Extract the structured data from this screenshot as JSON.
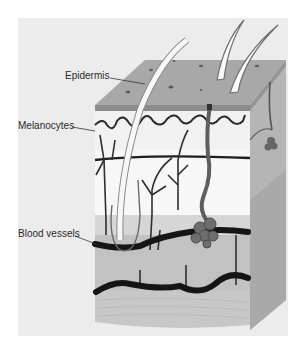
{
  "figure": {
    "labels": [
      {
        "id": "epidermis",
        "text": "Epidermis"
      },
      {
        "id": "melanocytes",
        "text": "Melanocytes"
      },
      {
        "id": "blood_vessels",
        "text": "Blood vessels"
      }
    ]
  },
  "colors": {
    "background": "#ececec",
    "epidermis_top": "#a9a9a9",
    "epidermis_edge": "#8f8f8f",
    "dermis_upper": "#f4f4f4",
    "dermis_band": "#d9d9d9",
    "dermis_lower": "#bdbdbd",
    "subcutis": "#c4c4c4",
    "side_face": "#b3b3b3",
    "vessel": "#1f1f1f",
    "label_text": "#2a2a2a"
  }
}
